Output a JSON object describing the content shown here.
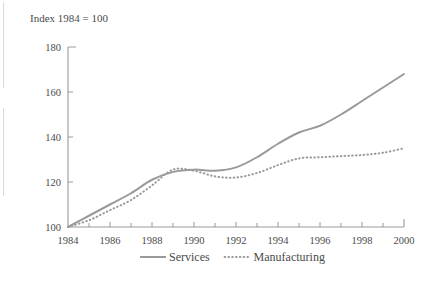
{
  "figure": {
    "axis_note": "Index 1984 = 100"
  },
  "chart_data": {
    "type": "line",
    "title": "",
    "subtitle": "",
    "axis_note": "Index 1984 = 100",
    "xlabel": "",
    "ylabel": "",
    "xlim": [
      1984,
      2000
    ],
    "ylim": [
      100,
      180
    ],
    "ytick_labels": [
      "100",
      "120",
      "140",
      "160",
      "180"
    ],
    "ytick_values": [
      100,
      120,
      140,
      160,
      180
    ],
    "xtick_labels": [
      "1984",
      "1986",
      "1988",
      "1990",
      "1992",
      "1994",
      "1996",
      "1998",
      "2000"
    ],
    "xtick_values": [
      1984,
      1986,
      1988,
      1990,
      1992,
      1994,
      1996,
      1998,
      2000
    ],
    "minor_xtick_values": [
      1985,
      1987,
      1989,
      1991,
      1993,
      1995,
      1997,
      1999
    ],
    "grid": false,
    "legend_position": "bottom",
    "x": [
      1984,
      1985,
      1986,
      1987,
      1988,
      1989,
      1990,
      1991,
      1992,
      1993,
      1994,
      1995,
      1996,
      1997,
      1998,
      1999,
      2000
    ],
    "series": [
      {
        "name": "Services",
        "style": "solid",
        "color": "#9a9a9a",
        "values": [
          100,
          105,
          110,
          115,
          121,
          124.5,
          125.5,
          125,
          126.5,
          131,
          137,
          142,
          145,
          150,
          156,
          162,
          168
        ]
      },
      {
        "name": "Manufacturing",
        "style": "dotted",
        "color": "#9a9a9a",
        "values": [
          100,
          103,
          107.5,
          112,
          118.5,
          125.5,
          125,
          122.5,
          122,
          124,
          127.5,
          130.5,
          131,
          131.5,
          132,
          133,
          135
        ]
      }
    ]
  },
  "legend": {
    "items": [
      {
        "label": "Services",
        "style": "solid"
      },
      {
        "label": "Manufacturing",
        "style": "dotted"
      }
    ]
  }
}
